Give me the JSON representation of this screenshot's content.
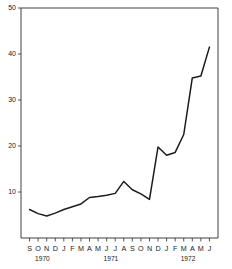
{
  "chart_data": {
    "type": "line",
    "title": "",
    "subtitle": "",
    "xlabel": "",
    "ylabel": "",
    "ylim": [
      0,
      50
    ],
    "grid": false,
    "legend": null,
    "y_ticks": [
      10,
      20,
      30,
      40,
      50
    ],
    "y_tick_labels": [
      "10",
      "20",
      "30",
      "40",
      "50"
    ],
    "x": [
      "S",
      "O",
      "N",
      "D",
      "J",
      "F",
      "M",
      "A",
      "M",
      "J",
      "J",
      "A",
      "S",
      "O",
      "N",
      "D",
      "J",
      "F",
      "M",
      "A",
      "M",
      "J"
    ],
    "x_tick_labels": [
      "S",
      "O",
      "N",
      "D",
      "J",
      "F",
      "M",
      "A",
      "M",
      "J",
      "J",
      "A",
      "S",
      "O",
      "N",
      "D",
      "J",
      "F",
      "M",
      "A",
      "M",
      "J"
    ],
    "values": [
      6.2,
      5.3,
      4.8,
      5.4,
      6.2,
      6.8,
      7.4,
      8.8,
      9.0,
      9.3,
      9.7,
      12.3,
      10.5,
      9.6,
      8.4,
      19.8,
      18.0,
      18.6,
      22.5,
      34.8,
      35.2,
      41.5
    ],
    "series": [
      {
        "name": "value",
        "points": [
          {
            "month": "S",
            "year": "1970",
            "value": 6.2
          },
          {
            "month": "O",
            "year": "1970",
            "value": 5.3
          },
          {
            "month": "N",
            "year": "1970",
            "value": 4.8
          },
          {
            "month": "D",
            "year": "1970",
            "value": 5.4
          },
          {
            "month": "J",
            "year": "1971",
            "value": 6.2
          },
          {
            "month": "F",
            "year": "1971",
            "value": 6.8
          },
          {
            "month": "M",
            "year": "1971",
            "value": 7.4
          },
          {
            "month": "A",
            "year": "1971",
            "value": 8.8
          },
          {
            "month": "M",
            "year": "1971",
            "value": 9.0
          },
          {
            "month": "J",
            "year": "1971",
            "value": 9.3
          },
          {
            "month": "J",
            "year": "1971",
            "value": 9.7
          },
          {
            "month": "A",
            "year": "1971",
            "value": 12.3
          },
          {
            "month": "S",
            "year": "1971",
            "value": 10.5
          },
          {
            "month": "O",
            "year": "1971",
            "value": 9.6
          },
          {
            "month": "N",
            "year": "1971",
            "value": 8.4
          },
          {
            "month": "D",
            "year": "1971",
            "value": 19.8
          },
          {
            "month": "J",
            "year": "1972",
            "value": 18.0
          },
          {
            "month": "F",
            "year": "1972",
            "value": 18.6
          },
          {
            "month": "M",
            "year": "1972",
            "value": 22.5
          },
          {
            "month": "A",
            "year": "1972",
            "value": 34.8
          },
          {
            "month": "M",
            "year": "1972",
            "value": 35.2
          },
          {
            "month": "J",
            "year": "1972",
            "value": 41.5
          }
        ]
      }
    ],
    "year_groups": [
      {
        "label": "1970",
        "months": [
          "S",
          "O",
          "N",
          "D"
        ]
      },
      {
        "label": "1971",
        "months": [
          "J",
          "F",
          "M",
          "A",
          "M",
          "J",
          "J",
          "A",
          "S",
          "O",
          "N",
          "D"
        ]
      },
      {
        "label": "1972",
        "months": [
          "J",
          "F",
          "M",
          "A",
          "M",
          "J"
        ]
      }
    ]
  },
  "colors": {
    "line": "#1c1c1c",
    "axis": "#2b2b2b",
    "background": "#ffffff"
  }
}
